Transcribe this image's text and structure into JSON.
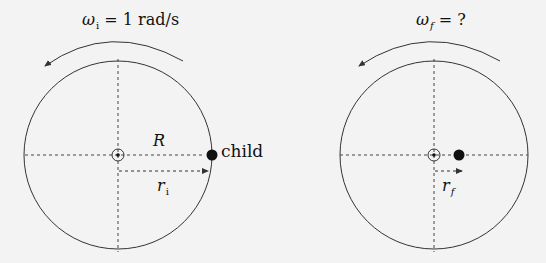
{
  "diagram": {
    "colors": {
      "background": "#f3f3f3",
      "stroke": "#333333",
      "dashed": "#444444",
      "child_dot": "#111111"
    },
    "panels": [
      {
        "id": "initial",
        "omega_symbol": "ω",
        "omega_subscript": "i",
        "omega_value": "= 1 rad/s",
        "rotation_direction": "counterclockwise",
        "radius_label": "R",
        "child_label": "child",
        "r_symbol": "r",
        "r_subscript": "i",
        "child_position": "at rim (r = R)"
      },
      {
        "id": "final",
        "omega_symbol": "ω",
        "omega_subscript": "f",
        "omega_value": "= ?",
        "rotation_direction": "counterclockwise",
        "r_symbol": "r",
        "r_subscript": "f",
        "child_position": "near center"
      }
    ]
  }
}
